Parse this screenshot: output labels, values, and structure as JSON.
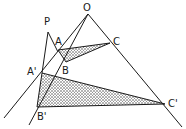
{
  "diagram": {
    "stroke_color": "#1a1a1a",
    "fill_color": "#555555",
    "labels": {
      "O": "O",
      "P": "P",
      "A": "A",
      "B": "B",
      "C": "C",
      "A_prime": "A'",
      "B_prime": "B'",
      "C_prime": "C'"
    },
    "points": {
      "O": [
        88,
        14
      ],
      "P": [
        48,
        32
      ],
      "A": [
        58,
        50
      ],
      "B": [
        66,
        62
      ],
      "C": [
        110,
        43
      ],
      "A_prime": [
        42,
        73
      ],
      "B_prime": [
        37,
        107
      ],
      "C_prime": [
        165,
        104
      ]
    }
  }
}
